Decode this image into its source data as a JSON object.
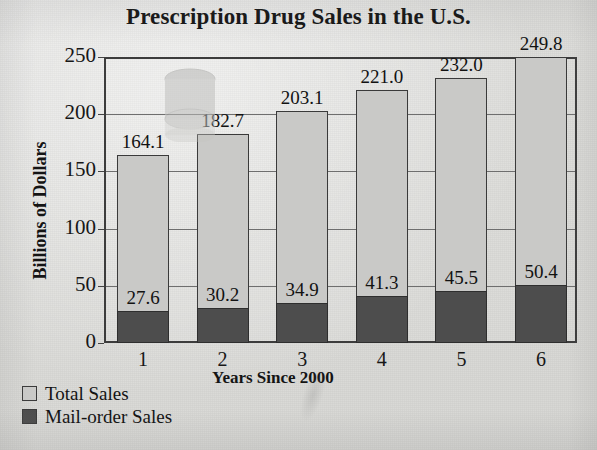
{
  "chart_data": {
    "type": "bar",
    "title": "Prescription Drug Sales in the U.S.",
    "xlabel": "Years Since 2000",
    "ylabel": "Billions of Dollars",
    "categories": [
      "1",
      "2",
      "3",
      "4",
      "5",
      "6"
    ],
    "series": [
      {
        "name": "Total Sales",
        "color": "#c9c9c7",
        "values": [
          164.1,
          182.7,
          203.1,
          221.0,
          232.0,
          249.8
        ],
        "labels": [
          "164.1",
          "182.7",
          "203.1",
          "221.0",
          "232.0",
          "249.8"
        ]
      },
      {
        "name": "Mail-order Sales",
        "color": "#4d4d4d",
        "values": [
          27.6,
          30.2,
          34.9,
          41.3,
          45.5,
          50.4
        ],
        "labels": [
          "27.6",
          "30.2",
          "34.9",
          "41.3",
          "45.5",
          "50.4"
        ]
      }
    ],
    "ylim": [
      0,
      250
    ],
    "yticks": [
      0,
      50,
      100,
      150,
      200,
      250
    ],
    "ytick_labels": [
      "0",
      "50",
      "100",
      "150",
      "200",
      "250"
    ],
    "grid": true,
    "legend_position": "bottom-left",
    "overlap_style": "overlay"
  },
  "legend": {
    "items": [
      {
        "label": "Total Sales",
        "swatch": "light-gray-square"
      },
      {
        "label": "Mail-order Sales",
        "swatch": "dark-gray-square"
      }
    ]
  },
  "artifacts": {
    "ghost_cylinder": "faint-scan-ghost-cylinder"
  }
}
